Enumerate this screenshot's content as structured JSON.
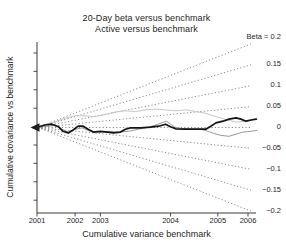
{
  "colors": {
    "background": "#ffffff",
    "axis": "#3a3a3a",
    "text": "#1e1e1e",
    "fan_line": "#7d7d7d",
    "series_black": "#141414",
    "series_gray": "#9a9a9a",
    "series_light_gray": "#c6c6c6"
  },
  "chart_data": {
    "type": "line",
    "title": "20-Day beta versus benchmark",
    "subtitle": "Active versus benchmark",
    "xlabel": "Cumulative variance benchmark",
    "ylabel": "Cumulative covariance vs benchmark",
    "ylim": [
      -0.2,
      0.2
    ],
    "grid": false,
    "legend_position": "right-edge-line-labels",
    "x_ticks": [
      {
        "label": "2001",
        "frac": 0.0
      },
      {
        "label": "2002",
        "frac": 0.178
      },
      {
        "label": "2003",
        "frac": 0.296
      },
      {
        "label": "2004",
        "frac": 0.624
      },
      {
        "label": "2005",
        "frac": 0.845
      },
      {
        "label": "2006",
        "frac": 0.986
      }
    ],
    "beta_fan": {
      "style": "dotted",
      "betas": [
        0.2,
        0.15,
        0.1,
        0.05,
        0,
        -0.05,
        -0.1,
        -0.15,
        -0.2
      ],
      "labels": [
        "Beta = 0.2",
        "0.15",
        "0.1",
        "0.05",
        "0",
        "−0.05",
        "−0.1",
        "−0.15",
        "−0.2"
      ]
    },
    "series": [
      {
        "name": "realized-beta-thick-black",
        "color_key": "series_black",
        "width": 1.7,
        "points": [
          [
            0,
            0
          ],
          [
            0.035,
            0.006
          ],
          [
            0.07,
            0.008
          ],
          [
            0.1,
            0.002
          ],
          [
            0.122,
            -0.009
          ],
          [
            0.146,
            -0.013
          ],
          [
            0.169,
            -0.006
          ],
          [
            0.192,
            0.003
          ],
          [
            0.216,
            0.003
          ],
          [
            0.239,
            -0.004
          ],
          [
            0.263,
            -0.011
          ],
          [
            0.296,
            -0.009
          ],
          [
            0.329,
            -0.011
          ],
          [
            0.357,
            -0.013
          ],
          [
            0.39,
            -0.011
          ],
          [
            0.413,
            -0.004
          ],
          [
            0.437,
            -0.001
          ],
          [
            0.484,
            -0.001
          ],
          [
            0.531,
            0.001
          ],
          [
            0.568,
            0.003
          ],
          [
            0.601,
            0.008
          ],
          [
            0.624,
            0.002
          ],
          [
            0.648,
            -0.003
          ],
          [
            0.695,
            -0.004
          ],
          [
            0.742,
            -0.004
          ],
          [
            0.789,
            -0.004
          ],
          [
            0.812,
            0.003
          ],
          [
            0.836,
            0.011
          ],
          [
            0.869,
            0.015
          ],
          [
            0.897,
            0.02
          ],
          [
            0.93,
            0.023
          ],
          [
            0.953,
            0.02
          ],
          [
            0.977,
            0.015
          ],
          [
            1.0,
            0.018
          ],
          [
            1.025,
            0.02
          ]
        ]
      },
      {
        "name": "realized-beta-gray",
        "color_key": "series_gray",
        "width": 1.0,
        "points": [
          [
            0,
            0
          ],
          [
            0.052,
            0.003
          ],
          [
            0.085,
            0.006
          ],
          [
            0.117,
            -0.004
          ],
          [
            0.146,
            -0.011
          ],
          [
            0.178,
            -0.004
          ],
          [
            0.211,
            -0.001
          ],
          [
            0.249,
            -0.009
          ],
          [
            0.286,
            -0.011
          ],
          [
            0.333,
            -0.009
          ],
          [
            0.38,
            -0.011
          ],
          [
            0.427,
            -0.009
          ],
          [
            0.474,
            -0.004
          ],
          [
            0.521,
            0.001
          ],
          [
            0.554,
            0.006
          ],
          [
            0.587,
            0.012
          ],
          [
            0.606,
            0.015
          ],
          [
            0.624,
            0.008
          ],
          [
            0.643,
            0.001
          ],
          [
            0.671,
            -0.002
          ],
          [
            0.718,
            -0.004
          ],
          [
            0.765,
            -0.004
          ],
          [
            0.798,
            -0.009
          ],
          [
            0.826,
            -0.014
          ],
          [
            0.859,
            -0.019
          ],
          [
            0.897,
            -0.021
          ],
          [
            0.93,
            -0.016
          ],
          [
            0.962,
            -0.011
          ],
          [
            1.0,
            -0.009
          ],
          [
            1.028,
            -0.007
          ]
        ]
      },
      {
        "name": "realized-beta-light-gray",
        "color_key": "series_light_gray",
        "width": 1.0,
        "points": [
          [
            0,
            0
          ],
          [
            0.038,
            0.007
          ],
          [
            0.085,
            0.014
          ],
          [
            0.131,
            0.022
          ],
          [
            0.178,
            0.028
          ],
          [
            0.225,
            0.028
          ],
          [
            0.272,
            0.026
          ],
          [
            0.319,
            0.031
          ],
          [
            0.366,
            0.037
          ],
          [
            0.413,
            0.04
          ],
          [
            0.46,
            0.038
          ],
          [
            0.507,
            0.042
          ],
          [
            0.554,
            0.044
          ],
          [
            0.601,
            0.042
          ],
          [
            0.648,
            0.04
          ],
          [
            0.695,
            0.042
          ],
          [
            0.742,
            0.038
          ],
          [
            0.789,
            0.034
          ],
          [
            0.836,
            0.026
          ],
          [
            0.883,
            0.019
          ],
          [
            0.93,
            0.013
          ],
          [
            0.977,
            0.015
          ],
          [
            1.019,
            0.02
          ]
        ]
      }
    ]
  }
}
